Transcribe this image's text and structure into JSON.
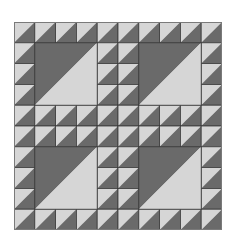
{
  "quilt": {
    "title": "Half-square triangle quilt block",
    "grid_size": 10,
    "colors": {
      "light": "#d6d6d6",
      "dark": "#6a6a6a",
      "line": "#3a3a3a",
      "outer_border": "#7a7a7a"
    },
    "large_blocks": [
      {
        "row": 1,
        "col": 1,
        "span": 3
      },
      {
        "row": 1,
        "col": 6,
        "span": 3
      },
      {
        "row": 6,
        "col": 1,
        "span": 3
      },
      {
        "row": 6,
        "col": 6,
        "span": 3
      }
    ],
    "cell_pattern": "light upper-left, dark lower-right"
  }
}
